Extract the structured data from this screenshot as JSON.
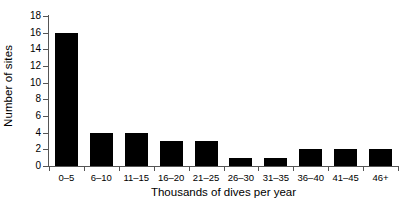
{
  "chart_data": {
    "type": "bar",
    "title": "",
    "xlabel": "Thousands of dives per year",
    "ylabel": "Number of sites",
    "categories": [
      "0–5",
      "6–10",
      "11–15",
      "16–20",
      "21–25",
      "26–30",
      "31–35",
      "36–40",
      "41–45",
      "46+"
    ],
    "values": [
      16,
      4,
      4,
      3,
      3,
      1,
      1,
      2,
      2,
      2
    ],
    "ylim": [
      0,
      18
    ],
    "yticks": [
      0,
      2,
      4,
      6,
      8,
      10,
      12,
      14,
      16,
      18
    ],
    "ytick_labels": [
      "0",
      "2",
      "4",
      "6",
      "8",
      "10",
      "12",
      "14",
      "16",
      "18"
    ],
    "grid": false,
    "legend": false,
    "bar_color": "#000000",
    "axis_color": "#555555",
    "background": "#ffffff"
  }
}
